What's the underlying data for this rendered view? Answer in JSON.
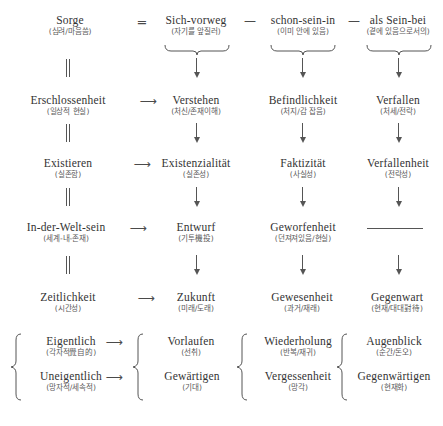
{
  "diagram": {
    "columns": [
      {
        "id": "col1",
        "name": "identity-column"
      },
      {
        "id": "col2",
        "name": "sich-vorweg-column"
      },
      {
        "id": "col3",
        "name": "schon-sein-in-column"
      },
      {
        "id": "col4",
        "name": "als-sein-bei-column"
      }
    ],
    "rows": [
      {
        "id": "row-sorge",
        "cells": [
          {
            "term": "Sorge",
            "gloss": "(심려/마음씀)"
          },
          {
            "term": "Sich-vorweg",
            "gloss": "(자기를 앞질러)"
          },
          {
            "term": "schon-sein-in",
            "gloss": "(이미 안에 있음)"
          },
          {
            "term": "als Sein-bei",
            "gloss": "(곁에 있음으로서의)"
          }
        ]
      },
      {
        "id": "row-erschlossenheit",
        "cells": [
          {
            "term": "Erschlossenheit",
            "gloss": "(일상적 현실)"
          },
          {
            "term": "Verstehen",
            "gloss": "(처신/존재이해)"
          },
          {
            "term": "Befindlichkeit",
            "gloss": "(처지/감 잡음)"
          },
          {
            "term": "Verfallen",
            "gloss": "(처세/전락)"
          }
        ]
      },
      {
        "id": "row-existieren",
        "cells": [
          {
            "term": "Existieren",
            "gloss": "(실존함)"
          },
          {
            "term": "Existenzialität",
            "gloss": "(실존성)"
          },
          {
            "term": "Faktizität",
            "gloss": "(사실성)"
          },
          {
            "term": "Verfallenheit",
            "gloss": "(전락성)"
          }
        ]
      },
      {
        "id": "row-in-der-welt-sein",
        "cells": [
          {
            "term": "In-der-Welt-sein",
            "gloss": "(세계-내-존재)"
          },
          {
            "term": "Entwurf",
            "gloss": "(기투機投)"
          },
          {
            "term": "Geworfenheit",
            "gloss": "(던져져있음/현실)"
          },
          {
            "term": "",
            "gloss": ""
          }
        ]
      },
      {
        "id": "row-zeitlichkeit",
        "cells": [
          {
            "term": "Zeitlichkeit",
            "gloss": "(시간성)"
          },
          {
            "term": "Zukunft",
            "gloss": "(미래/도래)"
          },
          {
            "term": "Gewesenheit",
            "gloss": "(과거/재래)"
          },
          {
            "term": "Gegenwart",
            "gloss": "(현재/대대對待)"
          }
        ]
      },
      {
        "id": "row-eigentlich",
        "cells": [
          {
            "term": "Eigentlich",
            "gloss": "(각자적覺自的)"
          },
          {
            "term": "Vorlaufen",
            "gloss": "(선취)"
          },
          {
            "term": "Wiederholung",
            "gloss": "(반복/재귀)"
          },
          {
            "term": "Augenblick",
            "gloss": "(순간/돈오)"
          }
        ]
      },
      {
        "id": "row-uneigentlich",
        "cells": [
          {
            "term": "Uneigentlich",
            "gloss": "(망자적/세속적)"
          },
          {
            "term": "Gewärtigen",
            "gloss": "(기대)"
          },
          {
            "term": "Vergessenheit",
            "gloss": "(망각)"
          },
          {
            "term": "Gegenwärtigen",
            "gloss": "(현재화)"
          }
        ]
      }
    ],
    "connectors": {
      "equals": "═",
      "dash": "—",
      "right_arrow": "⟶"
    },
    "colors": {
      "term_text": "#333333",
      "gloss_text": "#5a5a5a",
      "rule": "#555555",
      "background": "#ffffff"
    }
  }
}
